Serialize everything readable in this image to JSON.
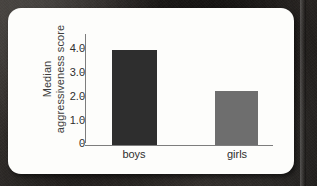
{
  "figure": {
    "card_background": "#fdfdfb",
    "page_background": "#2a2724"
  },
  "chart_data": {
    "type": "bar",
    "title": "",
    "categories": [
      "boys",
      "girls"
    ],
    "values": [
      3.5,
      2.0
    ],
    "series": [
      {
        "name": "Median aggressiveness score",
        "values": [
          3.5,
          2.0
        ],
        "colors": [
          "#2e2e2e",
          "#6e6e6e"
        ]
      }
    ],
    "xlabel": "",
    "ylabel": "Median aggressiveness score",
    "ylabel_lines": [
      "Median",
      "aggressiveness score"
    ],
    "ylim": [
      0,
      4.0
    ],
    "yticks": [
      0,
      1.0,
      2.0,
      3.0,
      4.0
    ],
    "ytick_labels": [
      "0",
      "1.0",
      "2.0",
      "3.0",
      "4.0"
    ],
    "xtick_labels": [
      "boys",
      "girls"
    ],
    "grid": false,
    "legend": null,
    "legend_position": "none",
    "bar_colors": {
      "boys": "#2e2e2e",
      "girls": "#6e6e6e"
    },
    "axis_color": "#7d7d7d"
  }
}
